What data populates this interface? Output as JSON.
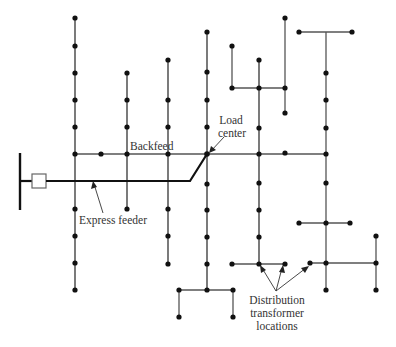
{
  "labels": {
    "backfeed": "Backfeed",
    "load_center_line1": "Load",
    "load_center_line2": "center",
    "express_feeder": "Express feeder",
    "dist_line1": "Distribution",
    "dist_line2": "transformer",
    "dist_line3": "locations"
  },
  "colors": {
    "wire": "#555555",
    "feeder": "#111111",
    "node": "#111111",
    "background": "#ffffff"
  },
  "diagram": {
    "type": "radial distribution feeder with express feeder to load center",
    "substation_bus": {
      "x": 20,
      "y1": 153,
      "y2": 210
    },
    "breaker": {
      "x": 32,
      "y": 174,
      "w": 14,
      "h": 14
    },
    "express_feeder_path": [
      [
        20,
        181
      ],
      [
        32,
        181
      ],
      [
        46,
        181
      ],
      [
        190,
        181
      ],
      [
        207,
        154
      ]
    ],
    "load_center": {
      "x": 207,
      "y": 154
    }
  }
}
